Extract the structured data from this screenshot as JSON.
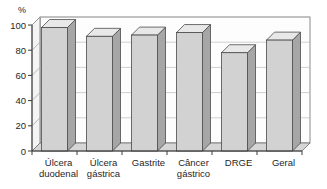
{
  "chart_data": {
    "type": "bar",
    "title": "",
    "subtitle": "",
    "xlabel": "",
    "ylabel": "%",
    "unit_label": "%",
    "categories": [
      "Úlcera duodenal",
      "Úlcera gástrica",
      "Gastrite",
      "Câncer gástrico",
      "DRGE",
      "Geral"
    ],
    "category_lines": [
      [
        "Úlcera",
        "duodenal"
      ],
      [
        "Úlcera",
        "gástrica"
      ],
      [
        "Gastrite"
      ],
      [
        "Câncer",
        "gástrico"
      ],
      [
        "DRGE"
      ],
      [
        "Geral"
      ]
    ],
    "values": [
      98,
      91,
      92,
      94,
      78,
      88
    ],
    "ylim": [
      0,
      100
    ],
    "yticks": [
      0,
      20,
      40,
      60,
      80,
      100
    ],
    "ytick_labels": [
      "0",
      "20",
      "40",
      "60",
      "80",
      "100"
    ],
    "grid": true,
    "grid_axis": "y",
    "legend": null,
    "legend_position": "none",
    "style": "3d-columns",
    "colors": {
      "bar_front": "#d2d2d2",
      "bar_top": "#e8e8e8",
      "bar_side": "#a6a6a6",
      "bar_outline": "#4a4a4a",
      "plot_background": "#fbfbfb",
      "wall_back": "#ffffff",
      "floor": "#cfcfcf",
      "gridline": "#b4b4b4",
      "axis": "#3a3a3a",
      "text": "#1f1f1f"
    }
  }
}
